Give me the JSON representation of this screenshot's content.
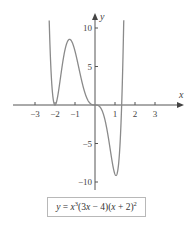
{
  "chart_data": {
    "type": "line",
    "title": "",
    "equation": "y = x^3(3x - 4)(x + 2)^2",
    "caption": {
      "lhs": "y",
      "eq": " = ",
      "x1": "x",
      "exp1": "3",
      "f1a": "(3",
      "f1x": "x",
      "f1b": " − 4)(",
      "f2x": "x",
      "f2b": " + 2)",
      "exp2": "2"
    },
    "xlabel": "x",
    "ylabel": "y",
    "xlim": [
      -4,
      4.4
    ],
    "ylim": [
      -11,
      11.8
    ],
    "x_ticks": [
      -3,
      -2,
      -1,
      1,
      2,
      3
    ],
    "x_tick_labels": [
      "−3",
      "−2",
      "−1",
      "1",
      "2",
      "3"
    ],
    "y_ticks": [
      10,
      5,
      -5,
      -10
    ],
    "y_tick_labels": [
      "10",
      "5",
      "−5",
      "−10"
    ],
    "grid": false,
    "legend": null,
    "series": [
      {
        "name": "y = x^3(3x-4)(x+2)^2",
        "color": "#8a8a8a",
        "key_points": [
          {
            "x": -2.35,
            "y": 11.0,
            "note": "curve exits top"
          },
          {
            "x": -2,
            "y": 0,
            "note": "double root (touches axis)"
          },
          {
            "x": -1.28,
            "y": 8.6,
            "note": "local max"
          },
          {
            "x": 0,
            "y": 0,
            "note": "triple root (inflection)"
          },
          {
            "x": 1.09,
            "y": -9.1,
            "note": "local min"
          },
          {
            "x": 1.333,
            "y": 0,
            "note": "root"
          },
          {
            "x": 1.46,
            "y": 11.0,
            "note": "curve exits top"
          }
        ]
      }
    ]
  }
}
